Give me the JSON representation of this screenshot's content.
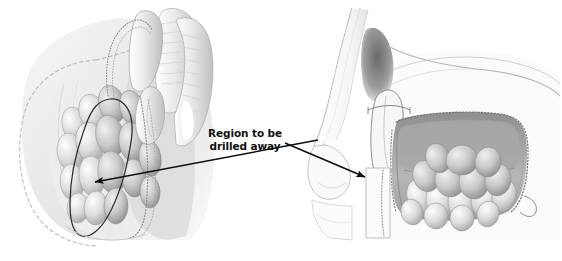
{
  "figure": {
    "kind": "medical-illustration",
    "background_color": "#ffffff",
    "width": 562,
    "height": 261,
    "style": "graphite pencil rendering, grayscale"
  },
  "callout": {
    "line1": "Region to be",
    "line2": "drilled away",
    "text_color": "#111111",
    "arrows": [
      {
        "name": "left-arrow",
        "from_x": 318,
        "from_y": 140,
        "to_x": 91,
        "to_y": 183,
        "points_to": "left-panel-drill-region"
      },
      {
        "name": "right-arrow",
        "from_x": 289,
        "from_y": 143,
        "to_x": 369,
        "to_y": 178,
        "points_to": "right-panel-antrostomy-edge"
      }
    ]
  },
  "panels": [
    {
      "name": "left-panel",
      "view": "endoscopic anterior view of nasal cavity",
      "x": 4,
      "y": 2,
      "width": 225,
      "height": 240,
      "features": [
        {
          "name": "dashed-tissue-outline",
          "stroke": "#b9b9b9",
          "style": "dashed"
        },
        {
          "name": "drill-region-outline",
          "stroke": "#2b2b2b",
          "style": "solid"
        },
        {
          "name": "lobular-mass-cluster",
          "fill": "#d9d9d9"
        },
        {
          "name": "middle-turbinate",
          "fill": "#e6e6e6"
        },
        {
          "name": "septum",
          "fill": "#ececec"
        },
        {
          "name": "stippled-mucosal-edge",
          "stroke": "#8a8a8a"
        }
      ]
    },
    {
      "name": "right-panel",
      "view": "sagittal section of nose and maxillary sinus",
      "x": 305,
      "y": 2,
      "width": 255,
      "height": 240,
      "features": [
        {
          "name": "nasal-dorsum-profile",
          "stroke": "#9a9a9a"
        },
        {
          "name": "nasal-airway-shadow",
          "fill": "#8e8e8e"
        },
        {
          "name": "antrostomy-window",
          "stroke": "#6f6f6f"
        },
        {
          "name": "sinus-cavity-interior",
          "fill": "#b4b4b4"
        },
        {
          "name": "lobular-mass-cluster",
          "fill": "#dcdcdc"
        },
        {
          "name": "inferior-turbinate-flap",
          "fill": "#ededed"
        },
        {
          "name": "stippled-cavity-border",
          "stroke": "#7d7d7d"
        },
        {
          "name": "upper-lip-profile",
          "stroke": "#c2c2c2"
        }
      ]
    }
  ],
  "colors": {
    "ink": "#111111",
    "mid_gray": "#9a9a9a",
    "light_gray": "#d8d8d8",
    "shadow_gray": "#6d6d6d",
    "paper": "#ffffff"
  }
}
